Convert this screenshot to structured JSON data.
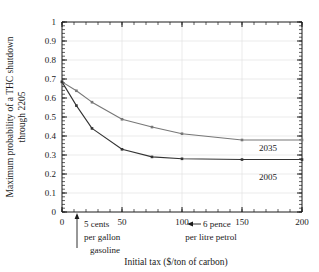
{
  "chart_data": {
    "type": "line",
    "title": "",
    "xlabel": "Initial tax  ($/ton of carbon)",
    "ylabel": "Maximum probability of a THC shutdown through 2205",
    "ylabel_line1": "Maximum probability of a THC shutdown",
    "ylabel_line2": "through 2205",
    "xlim": [
      0,
      200
    ],
    "ylim": [
      0,
      1
    ],
    "xticks": [
      0,
      50,
      100,
      150,
      200
    ],
    "xtick_labels": [
      "0",
      "50",
      "100",
      "150",
      "200"
    ],
    "xminor_step": 10,
    "yticks": [
      0,
      0.1,
      0.2,
      0.3,
      0.4,
      0.5,
      0.6,
      0.7,
      0.8,
      0.9,
      1
    ],
    "ytick_labels": [
      "0",
      "0.1",
      "0.2",
      "0.3",
      "0.4",
      "0.5",
      "0.6",
      "0.7",
      "0.8",
      "0.9",
      "1"
    ],
    "yminor_step": 0.02,
    "grid": "horizontal",
    "legend": "inline-labels",
    "series": [
      {
        "name": "2035",
        "color": "#777777",
        "label": "2035",
        "x": [
          0,
          12,
          25,
          50,
          75,
          100,
          150,
          200
        ],
        "values": [
          0.685,
          0.638,
          0.578,
          0.488,
          0.447,
          0.412,
          0.379,
          0.379
        ]
      },
      {
        "name": "2005",
        "color": "#333333",
        "label": "2005",
        "x": [
          0,
          12,
          25,
          50,
          75,
          100,
          150,
          200
        ],
        "values": [
          0.685,
          0.56,
          0.44,
          0.33,
          0.29,
          0.28,
          0.276,
          0.276
        ]
      }
    ],
    "annotations": [
      {
        "name": "gasoline-tax-marker",
        "x_value": 13,
        "arrow": "up",
        "line1": "5 cents",
        "line2": "per gallon",
        "line3": "gasoline"
      },
      {
        "name": "petrol-tax-marker",
        "x_value": 105,
        "arrow": "left",
        "line1": "6 pence",
        "line2": "per litre petrol"
      }
    ]
  },
  "colors": {
    "axis": "#1a1a1a",
    "grid": "#e2e2e2",
    "series_2035": "#777777",
    "series_2005": "#333333",
    "background": "#ffffff"
  }
}
